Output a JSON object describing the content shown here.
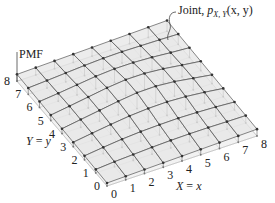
{
  "chart_data": {
    "type": "3d-surface-stem",
    "annotation": {
      "prefix": "Joint, ",
      "func": "p",
      "sub": "X, Y",
      "args": "(x, y)"
    },
    "zlabel": "PMF",
    "xlabel": {
      "var": "X",
      "eq": " = ",
      "val": "x"
    },
    "ylabel": {
      "var": "Y",
      "eq": " = ",
      "val": "y"
    },
    "x_ticks": [
      "0",
      "1",
      "2",
      "3",
      "4",
      "5",
      "6",
      "7",
      "8"
    ],
    "y_ticks": [
      "0",
      "1",
      "2",
      "3",
      "4",
      "5",
      "6",
      "7",
      "8"
    ],
    "x_range": [
      0,
      8
    ],
    "y_range": [
      0,
      8
    ],
    "grid": true,
    "heights_note": "relative PMF heights, rows indexed by y (0..8), columns by x (0..8)",
    "heights": [
      [
        0.0,
        0.3,
        0.6,
        0.9,
        1.2,
        1.5,
        1.8,
        2.1,
        2.4
      ],
      [
        0.3,
        1.2,
        1.8,
        2.4,
        2.8,
        3.0,
        3.0,
        2.8,
        2.7
      ],
      [
        0.6,
        2.0,
        3.2,
        4.0,
        4.4,
        4.6,
        4.3,
        3.8,
        3.0
      ],
      [
        0.9,
        2.6,
        4.2,
        5.6,
        6.4,
        6.6,
        6.0,
        4.8,
        3.3
      ],
      [
        1.2,
        3.0,
        4.8,
        6.6,
        8.0,
        8.2,
        7.2,
        5.4,
        3.6
      ],
      [
        1.5,
        3.2,
        5.0,
        6.8,
        8.0,
        8.0,
        7.0,
        5.4,
        3.9
      ],
      [
        1.8,
        3.0,
        4.4,
        5.8,
        6.6,
        6.6,
        6.0,
        5.0,
        4.2
      ],
      [
        2.1,
        2.8,
        3.6,
        4.4,
        5.0,
        5.2,
        5.0,
        4.8,
        4.5
      ],
      [
        2.4,
        2.7,
        3.0,
        3.3,
        3.6,
        3.9,
        4.2,
        4.5,
        4.8
      ]
    ]
  },
  "colors": {
    "surface": "#e6e6e6",
    "grid_line": "#555555",
    "stem": "#8a8a8a",
    "point": "#333333",
    "base_line": "#bbbbbb",
    "axis": "#444444"
  }
}
